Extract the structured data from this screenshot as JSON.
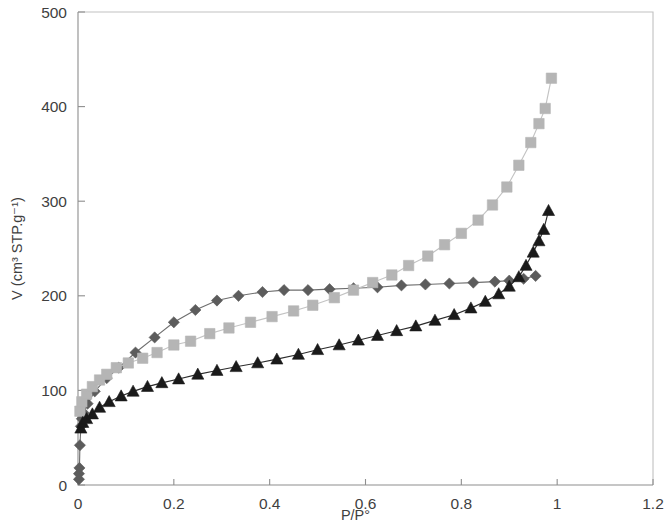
{
  "chart_data": {
    "type": "line",
    "title": "",
    "subtitle": "",
    "xlabel": "P/P°",
    "ylabel": "V (cm³ STP.g⁻¹)",
    "xlim": [
      0,
      1.2
    ],
    "ylim": [
      0,
      500
    ],
    "xticks": [
      0,
      0.2,
      0.4,
      0.6,
      0.8,
      1,
      1.2
    ],
    "xtick_labels": [
      "0",
      "0.2",
      "0.4",
      "0.6",
      "0.8",
      "1",
      "1.2"
    ],
    "yticks": [
      0,
      100,
      200,
      300,
      400,
      500
    ],
    "ytick_labels": [
      "0",
      "100",
      "200",
      "300",
      "400",
      "500"
    ],
    "grid": false,
    "legend": "none",
    "frame": "left-bottom-box",
    "series": [
      {
        "name": "sample-a-desorption",
        "marker": "diamond",
        "color": "#5c5c5c",
        "line_color": "#6e6e6e",
        "points": [
          {
            "x": 0.002,
            "y": 6
          },
          {
            "x": 0.002,
            "y": 12
          },
          {
            "x": 0.003,
            "y": 18
          },
          {
            "x": 0.004,
            "y": 42
          },
          {
            "x": 0.006,
            "y": 62
          },
          {
            "x": 0.008,
            "y": 70
          },
          {
            "x": 0.012,
            "y": 76
          },
          {
            "x": 0.02,
            "y": 86
          },
          {
            "x": 0.035,
            "y": 99
          },
          {
            "x": 0.06,
            "y": 113
          },
          {
            "x": 0.085,
            "y": 124
          },
          {
            "x": 0.12,
            "y": 140
          },
          {
            "x": 0.16,
            "y": 156
          },
          {
            "x": 0.2,
            "y": 172
          },
          {
            "x": 0.245,
            "y": 185
          },
          {
            "x": 0.29,
            "y": 195
          },
          {
            "x": 0.335,
            "y": 200
          },
          {
            "x": 0.385,
            "y": 204
          },
          {
            "x": 0.43,
            "y": 206
          },
          {
            "x": 0.48,
            "y": 206
          },
          {
            "x": 0.525,
            "y": 207
          },
          {
            "x": 0.575,
            "y": 208
          },
          {
            "x": 0.625,
            "y": 209
          },
          {
            "x": 0.675,
            "y": 211
          },
          {
            "x": 0.725,
            "y": 212
          },
          {
            "x": 0.775,
            "y": 213
          },
          {
            "x": 0.825,
            "y": 214
          },
          {
            "x": 0.87,
            "y": 215
          },
          {
            "x": 0.9,
            "y": 216
          },
          {
            "x": 0.93,
            "y": 218
          },
          {
            "x": 0.955,
            "y": 221
          }
        ]
      },
      {
        "name": "sample-a-adsorption",
        "marker": "square",
        "color": "#b5b5b5",
        "line_color": "#c3c3c3",
        "points": [
          {
            "x": 0.004,
            "y": 78
          },
          {
            "x": 0.008,
            "y": 88
          },
          {
            "x": 0.018,
            "y": 96
          },
          {
            "x": 0.03,
            "y": 104
          },
          {
            "x": 0.045,
            "y": 111
          },
          {
            "x": 0.06,
            "y": 117
          },
          {
            "x": 0.08,
            "y": 124
          },
          {
            "x": 0.105,
            "y": 129
          },
          {
            "x": 0.135,
            "y": 134
          },
          {
            "x": 0.165,
            "y": 140
          },
          {
            "x": 0.2,
            "y": 148
          },
          {
            "x": 0.235,
            "y": 152
          },
          {
            "x": 0.275,
            "y": 160
          },
          {
            "x": 0.315,
            "y": 166
          },
          {
            "x": 0.36,
            "y": 172
          },
          {
            "x": 0.405,
            "y": 178
          },
          {
            "x": 0.45,
            "y": 184
          },
          {
            "x": 0.49,
            "y": 190
          },
          {
            "x": 0.535,
            "y": 198
          },
          {
            "x": 0.575,
            "y": 206
          },
          {
            "x": 0.615,
            "y": 214
          },
          {
            "x": 0.655,
            "y": 222
          },
          {
            "x": 0.69,
            "y": 232
          },
          {
            "x": 0.73,
            "y": 242
          },
          {
            "x": 0.765,
            "y": 254
          },
          {
            "x": 0.8,
            "y": 266
          },
          {
            "x": 0.835,
            "y": 280
          },
          {
            "x": 0.865,
            "y": 296
          },
          {
            "x": 0.895,
            "y": 315
          },
          {
            "x": 0.92,
            "y": 338
          },
          {
            "x": 0.945,
            "y": 362
          },
          {
            "x": 0.962,
            "y": 382
          },
          {
            "x": 0.975,
            "y": 398
          },
          {
            "x": 0.988,
            "y": 430
          }
        ]
      },
      {
        "name": "sample-b",
        "marker": "triangle",
        "color": "#1a1a1a",
        "line_color": "#2b2b2b",
        "points": [
          {
            "x": 0.006,
            "y": 60
          },
          {
            "x": 0.01,
            "y": 66
          },
          {
            "x": 0.018,
            "y": 70
          },
          {
            "x": 0.03,
            "y": 75
          },
          {
            "x": 0.045,
            "y": 82
          },
          {
            "x": 0.065,
            "y": 88
          },
          {
            "x": 0.09,
            "y": 94
          },
          {
            "x": 0.115,
            "y": 99
          },
          {
            "x": 0.145,
            "y": 104
          },
          {
            "x": 0.175,
            "y": 108
          },
          {
            "x": 0.21,
            "y": 112
          },
          {
            "x": 0.25,
            "y": 117
          },
          {
            "x": 0.29,
            "y": 121
          },
          {
            "x": 0.33,
            "y": 125
          },
          {
            "x": 0.375,
            "y": 129
          },
          {
            "x": 0.415,
            "y": 133
          },
          {
            "x": 0.46,
            "y": 138
          },
          {
            "x": 0.5,
            "y": 143
          },
          {
            "x": 0.545,
            "y": 148
          },
          {
            "x": 0.585,
            "y": 153
          },
          {
            "x": 0.625,
            "y": 158
          },
          {
            "x": 0.665,
            "y": 163
          },
          {
            "x": 0.705,
            "y": 168
          },
          {
            "x": 0.745,
            "y": 174
          },
          {
            "x": 0.785,
            "y": 180
          },
          {
            "x": 0.82,
            "y": 187
          },
          {
            "x": 0.85,
            "y": 194
          },
          {
            "x": 0.878,
            "y": 202
          },
          {
            "x": 0.9,
            "y": 210
          },
          {
            "x": 0.92,
            "y": 220
          },
          {
            "x": 0.935,
            "y": 232
          },
          {
            "x": 0.95,
            "y": 246
          },
          {
            "x": 0.962,
            "y": 258
          },
          {
            "x": 0.972,
            "y": 270
          },
          {
            "x": 0.982,
            "y": 290
          }
        ]
      }
    ]
  }
}
